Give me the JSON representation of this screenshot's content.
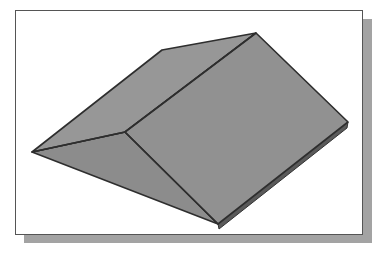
{
  "figure": {
    "frame": {
      "background": "#ffffff",
      "border": "#555555",
      "shadow": "#a3a3a3"
    },
    "model": {
      "fill": "#929292",
      "fill_dark": "#888888",
      "fill_light": "#999999",
      "edge": "#2e2e2e",
      "thickness_edge": "#555555",
      "vertices": {
        "left": [
          32,
          152
        ],
        "inner": [
          125,
          132
        ],
        "top_left": [
          162,
          50
        ],
        "top_right": [
          256,
          33
        ],
        "right": [
          348,
          122
        ],
        "bottom": [
          218,
          224
        ]
      }
    }
  }
}
